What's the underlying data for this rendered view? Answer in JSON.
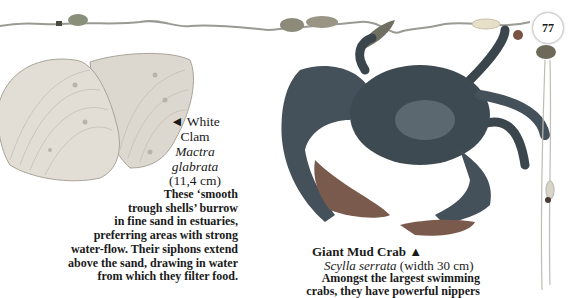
{
  "page": {
    "number": "77"
  },
  "clam": {
    "arrow": "◄",
    "title_line1": "White",
    "title_line2": "Clam",
    "latin_line1": "Mactra",
    "latin_line2": "glabrata",
    "size": "(11,4 cm)",
    "description_lines": [
      "These ‘smooth",
      "trough shells’ burrow",
      "in fine sand in estuaries,",
      "preferring areas with strong",
      "water-flow. Their siphons extend",
      "above the sand, drawing in water",
      "from which they filter food."
    ]
  },
  "crab": {
    "title": "Giant Mud Crab",
    "arrow": "▲",
    "latin": "Scylla serrata",
    "size": "(width 30 cm)",
    "description_lines": [
      "Amongst the largest swimming",
      "crabs, they have powerful nippers"
    ]
  },
  "colors": {
    "crab_body": "#3e4a52",
    "crab_claw": "#7a5a4c",
    "clam_shell": "#d9d6cf",
    "text": "#1a1a1a"
  }
}
